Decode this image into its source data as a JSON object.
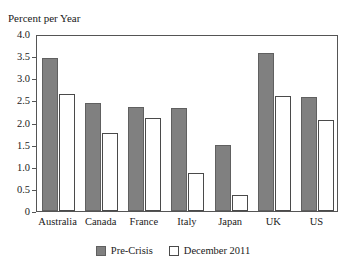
{
  "chart_data": {
    "type": "bar",
    "title": "",
    "xlabel": "",
    "ylabel": "Percent per Year",
    "ylim": [
      0,
      4.0
    ],
    "ytick_labels": [
      "4.0",
      "3.5",
      "3.0",
      "2.5",
      "2.0",
      "1.5",
      "1.0",
      "0.5",
      "0"
    ],
    "ytick_values": [
      4.0,
      3.5,
      3.0,
      2.5,
      2.0,
      1.5,
      1.0,
      0.5,
      0
    ],
    "grid": false,
    "legend_position": "bottom-center",
    "categories": [
      "Australia",
      "Canada",
      "France",
      "Italy",
      "Japan",
      "UK",
      "US"
    ],
    "series": [
      {
        "name": "Pre-Crisis",
        "color": "#808080",
        "values": [
          3.45,
          2.45,
          2.35,
          2.33,
          1.5,
          3.57,
          2.58
        ]
      },
      {
        "name": "December 2011",
        "color": "#ffffff",
        "values": [
          2.65,
          1.77,
          2.1,
          0.87,
          0.37,
          2.6,
          2.05
        ]
      }
    ]
  },
  "legend": {
    "items": [
      {
        "label": "Pre-Crisis",
        "swatch": "filled-gray-square"
      },
      {
        "label": "December 2011",
        "swatch": "outlined-white-square"
      }
    ]
  }
}
